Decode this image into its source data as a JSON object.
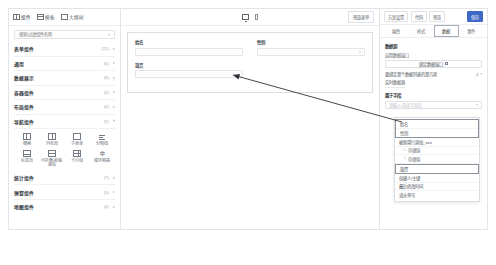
{
  "palette": {
    "tabs": [
      {
        "label": "组件",
        "icon": "grid-icon",
        "active": true
      },
      {
        "label": "模板",
        "icon": "template-icon",
        "active": false
      },
      {
        "label": "大纲树",
        "icon": "outline-icon",
        "active": false
      }
    ],
    "search": {
      "placeholder": "搜索/过滤组件名称",
      "value": ""
    },
    "categories": [
      {
        "label": "表单组件",
        "count": "(21)",
        "expanded": false
      },
      {
        "label": "通用",
        "count": "(6)",
        "expanded": false
      },
      {
        "label": "数据展示",
        "count": "(8)",
        "expanded": false
      },
      {
        "label": "容器组件",
        "count": "(6)",
        "expanded": false
      },
      {
        "label": "布局组件",
        "count": "(4)",
        "expanded": true
      },
      {
        "label": "导航组件",
        "count": "(5)",
        "expanded": false
      }
    ],
    "layout_tiles": [
      {
        "label": "栅格",
        "icon": "grid-split-icon"
      },
      {
        "label": "列布局",
        "icon": "two-column-icon"
      },
      {
        "label": "子表单",
        "icon": "subform-icon"
      },
      {
        "label": "分隔线",
        "icon": "divider-icon"
      },
      {
        "label": "标签页",
        "icon": "tabs-icon"
      },
      {
        "label": "可折叠/收缩面板",
        "icon": "collapse-panel-icon"
      },
      {
        "label": "卡片组",
        "icon": "card-group-icon"
      },
      {
        "label": "循环容器",
        "icon": "loop-container-icon"
      }
    ],
    "categories_bottom": [
      {
        "label": "统计组件",
        "count": "(7)",
        "expanded": false
      },
      {
        "label": "弹窗组件",
        "count": "(3)",
        "expanded": false
      },
      {
        "label": "地图组件",
        "count": "(4)",
        "expanded": false
      }
    ]
  },
  "center": {
    "devices": [
      {
        "name": "desktop",
        "icon": "monitor-icon",
        "active": true
      },
      {
        "name": "mobile",
        "icon": "phone-icon",
        "active": false
      }
    ],
    "preview_label": "预览表单",
    "form": {
      "rows": [
        [
          {
            "label": "姓名",
            "placeholder": "",
            "type": "text"
          },
          {
            "label": "性别",
            "placeholder": "",
            "type": "select"
          }
        ],
        [
          {
            "label": "籍贯",
            "placeholder": "",
            "type": "text"
          }
        ]
      ]
    }
  },
  "props": {
    "top_buttons": [
      {
        "label": "方案设置",
        "primary": false
      },
      {
        "label": "代码",
        "primary": false,
        "has_caret": true
      },
      {
        "label": "预览",
        "primary": false
      },
      {
        "label": "保存",
        "primary": true
      }
    ],
    "tabs": [
      {
        "label": "属性",
        "active": false
      },
      {
        "label": "样式",
        "active": false
      },
      {
        "label": "数据",
        "active": true
      },
      {
        "label": "事件",
        "active": false
      }
    ],
    "section_title": "数据源",
    "data_bind_label": "远程数据接口",
    "data_bind_button": "绑定数据接口",
    "data_bind_icon": "square-icon",
    "row_text": "要绑定第个数据列表的第几项",
    "row_select": "-1",
    "link_text": "实时数据源",
    "field_label": "属于字段",
    "field_placeholder": "请输入/选择字段名",
    "dropdown_items": [
      {
        "label": "姓名",
        "group": 1,
        "indent": false
      },
      {
        "label": "性别",
        "group": 1,
        "indent": false
      },
      {
        "label": "被新增行添加_xxx",
        "group": 0,
        "indent": false
      },
      {
        "label": "存储值",
        "group": 0,
        "indent": true
      },
      {
        "label": "存储值",
        "group": 0,
        "indent": true
      },
      {
        "label": "籍贯",
        "group": 2,
        "indent": false
      },
      {
        "label": "创建人/主键",
        "group": 0,
        "indent": false
      },
      {
        "label": "最后修改时间",
        "group": 0,
        "indent": false
      },
      {
        "label": "流水单号",
        "group": 0,
        "indent": false
      }
    ]
  },
  "colors": {
    "primary": "#3f68c6",
    "border": "#e2e4e8",
    "text": "#3c4048"
  }
}
